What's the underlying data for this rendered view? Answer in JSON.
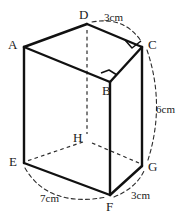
{
  "figure": {
    "type": "oblique-prism-diagram",
    "stroke_color": "#1a1a1a",
    "background_color": "#ffffff",
    "vertices": [
      {
        "id": "A",
        "label": "A",
        "x": 24,
        "y": 47,
        "hidden": false,
        "label_x": 8,
        "label_y": 38
      },
      {
        "id": "D",
        "label": "D",
        "x": 87,
        "y": 24,
        "hidden": false,
        "label_x": 79,
        "label_y": 8
      },
      {
        "id": "C",
        "label": "C",
        "x": 142,
        "y": 47,
        "hidden": false,
        "label_x": 148,
        "label_y": 38
      },
      {
        "id": "B",
        "label": "B",
        "x": 110,
        "y": 82,
        "hidden": false,
        "label_x": 102,
        "label_y": 84
      },
      {
        "id": "E",
        "label": "E",
        "x": 24,
        "y": 163,
        "hidden": false,
        "label_x": 9,
        "label_y": 155
      },
      {
        "id": "H",
        "label": "H",
        "x": 87,
        "y": 140,
        "hidden": true,
        "label_x": 73,
        "label_y": 131
      },
      {
        "id": "G",
        "label": "G",
        "x": 142,
        "y": 166,
        "hidden": false,
        "label_x": 148,
        "label_y": 160
      },
      {
        "id": "F",
        "label": "F",
        "x": 110,
        "y": 195,
        "hidden": false,
        "label_x": 106,
        "label_y": 200
      }
    ],
    "solid_edges": [
      {
        "name": "edge-A-D",
        "from": "A",
        "to": "D"
      },
      {
        "name": "edge-D-C",
        "from": "D",
        "to": "C"
      },
      {
        "name": "edge-A-B",
        "from": "A",
        "to": "B"
      },
      {
        "name": "edge-B-C",
        "from": "B",
        "to": "C"
      },
      {
        "name": "edge-A-E",
        "from": "A",
        "to": "E"
      },
      {
        "name": "edge-B-F",
        "from": "B",
        "to": "F"
      },
      {
        "name": "edge-C-G",
        "from": "C",
        "to": "G"
      },
      {
        "name": "edge-E-F",
        "from": "E",
        "to": "F"
      },
      {
        "name": "edge-F-G",
        "from": "F",
        "to": "G"
      }
    ],
    "hidden_edges": [
      {
        "name": "edge-D-H",
        "from": "D",
        "to": "H"
      },
      {
        "name": "edge-H-E",
        "from": "H",
        "to": "E"
      },
      {
        "name": "edge-H-G",
        "from": "H",
        "to": "G"
      }
    ],
    "right_angle_markers": [
      {
        "name": "right-angle-at-C",
        "at": "C",
        "size": 10
      },
      {
        "name": "right-angle-at-B",
        "at": "B",
        "size": 10
      }
    ],
    "dimensions": [
      {
        "id": "dim-top",
        "text": "3cm",
        "from": "D",
        "to": "C",
        "label_x": 104,
        "label_y": 12
      },
      {
        "id": "dim-right",
        "text": "6cm",
        "from": "C",
        "to": "G",
        "label_x": 156,
        "label_y": 104
      },
      {
        "id": "dim-bottom-right",
        "text": "3cm",
        "from": "F",
        "to": "G",
        "label_x": 131,
        "label_y": 190
      },
      {
        "id": "dim-bottom-left",
        "text": "7cm",
        "from": "E",
        "to": "F",
        "label_x": 40,
        "label_y": 193
      }
    ]
  }
}
